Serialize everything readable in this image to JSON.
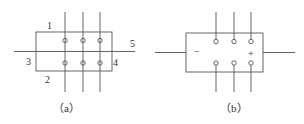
{
  "diagram_a": {
    "caption": "（a）",
    "labels": {
      "top": "1",
      "bottom": "2",
      "left": "3",
      "right": "4",
      "line": "5"
    }
  },
  "diagram_b": {
    "caption": "（b）",
    "minus": "−",
    "plus": "+"
  },
  "colors": {
    "stroke": "#555555",
    "text": "#333333"
  }
}
